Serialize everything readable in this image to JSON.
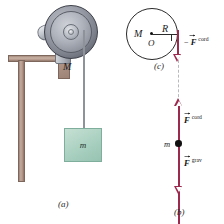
{
  "figure": {
    "panels": [
      {
        "id": "a",
        "letter": "(a)",
        "kind": "pictorial",
        "labels": {
          "pulley_mass": "M",
          "block_mass": "m"
        },
        "colors": {
          "block_fill": "#a9d0c0",
          "bracket": "#b59b8e",
          "pulley": "#7e828d",
          "cord": "#8e9299"
        }
      },
      {
        "id": "c",
        "letter": "(c)",
        "kind": "free-body-diagram",
        "labels": {
          "mass": "M",
          "center": "O",
          "radius": "R"
        },
        "force": {
          "sign": "−",
          "symbol": "F",
          "superscript": "cord",
          "direction": "down"
        },
        "colors": {
          "vector": "#9c2a4e",
          "outline": "#2a2a2a"
        }
      },
      {
        "id": "b",
        "letter": "(b)",
        "kind": "free-body-diagram",
        "labels": {
          "mass": "m"
        },
        "forces": [
          {
            "symbol": "F",
            "superscript": "cord",
            "direction": "up"
          },
          {
            "symbol": "F",
            "superscript": "grav",
            "direction": "down"
          }
        ],
        "colors": {
          "vector": "#9c2a4e",
          "dot": "#111111",
          "connector": "#b9b9bd"
        }
      }
    ]
  }
}
